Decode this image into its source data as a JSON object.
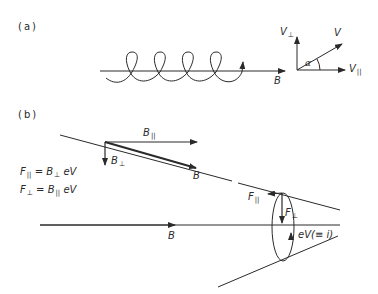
{
  "panels": {
    "a": {
      "label": "(a)"
    },
    "b": {
      "label": "(b)"
    }
  },
  "panel_a": {
    "field_label": "B",
    "v_perp_label": "V",
    "v_perp_sub": "⊥",
    "v_label": "V",
    "v_par_label": "V",
    "v_par_sub": "||",
    "angle_label": "α"
  },
  "panel_b": {
    "b_par_label": "B",
    "b_par_sub": "||",
    "b_perp_label": "B",
    "b_perp_sub": "⊥",
    "b_label": "B",
    "axis_b_label": "B",
    "f_par_label": "F",
    "f_par_sub": "||",
    "f_perp_label": "F",
    "f_perp_sub": "⊥",
    "current_label": "eV(≡ i)",
    "equations": [
      {
        "lhs": "F",
        "lhs_sub": "||",
        "eq": " = ",
        "rhs": "B",
        "rhs_sub": "⊥",
        "tail": " eV"
      },
      {
        "lhs": "F",
        "lhs_sub": "⊥",
        "eq": " = ",
        "rhs": "B",
        "rhs_sub": "||",
        "tail": " eV"
      }
    ]
  },
  "colors": {
    "ink": "#2a2a2a",
    "background": "#ffffff"
  }
}
